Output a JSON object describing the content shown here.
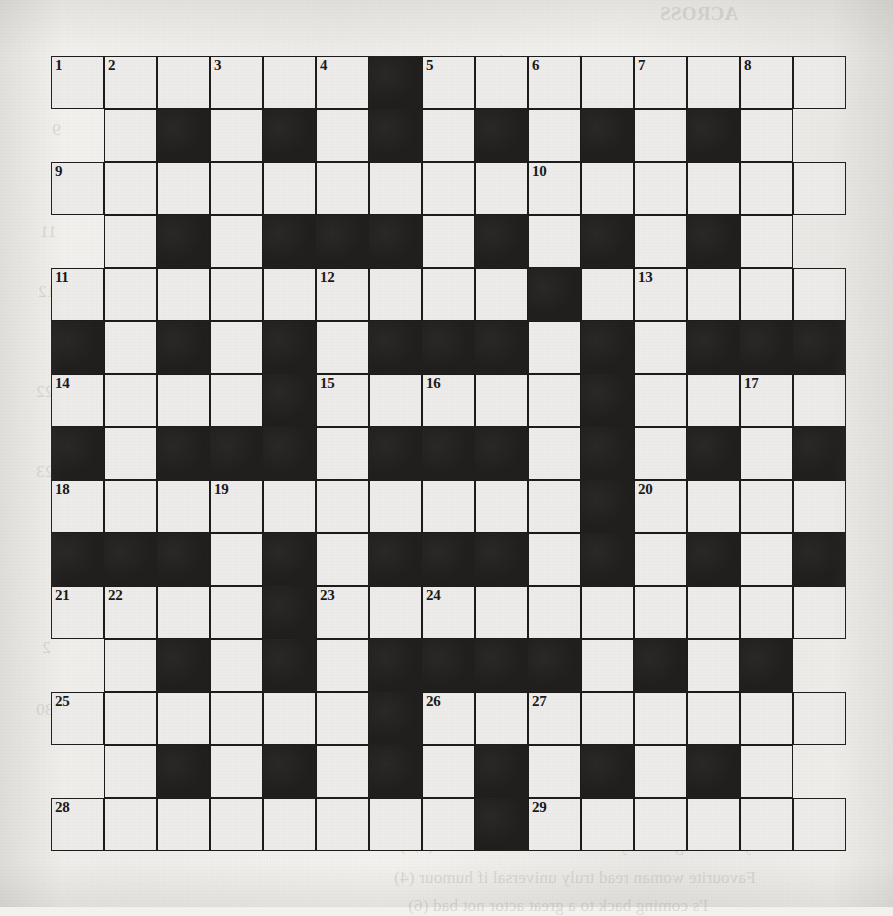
{
  "page": {
    "type": "printed crossword puzzle grid",
    "media": "scanned newspaper / puzzle-book page",
    "background_color": "#f2f1ee",
    "ink_color": "#1f1e1d",
    "cell_fill_color": "#edecea"
  },
  "grid": {
    "columns": 15,
    "rows": 15,
    "cell_size_px": 53,
    "origin_x_px": 51,
    "origin_y_px": 56,
    "legend": {
      "w": "white lettered square",
      "b": "blocked black square",
      "o": "outside the grid"
    },
    "rows_pattern": [
      "wwwwwwbwwwwwwww",
      "owbwbwbwbwbwbwo",
      "wwwwwwwwwwwwwww",
      "owbwbbbwbwbwbwo",
      "wwwwwwwwwbwwwww",
      "bwbwbwbbbwbwbbb",
      "wwwwbwwwwwbwwww",
      "bwbbbwbbbwbwbwb",
      "wwwwwwwwwwbwwww",
      "bbbwbwbbbwbwbwb",
      "wwwwbwwwwwwwwww",
      "owbwbwbbbbwbwbo",
      "wwwwwwbwwwwwwww",
      "owbwbwbwbwbwbwo",
      "wwwwwwwwbwwwwww"
    ],
    "numbered_cells": [
      {
        "number": 1,
        "row": 1,
        "col": 1
      },
      {
        "number": 2,
        "row": 1,
        "col": 2
      },
      {
        "number": 3,
        "row": 1,
        "col": 4
      },
      {
        "number": 4,
        "row": 1,
        "col": 6
      },
      {
        "number": 5,
        "row": 1,
        "col": 8
      },
      {
        "number": 6,
        "row": 1,
        "col": 10
      },
      {
        "number": 7,
        "row": 1,
        "col": 12
      },
      {
        "number": 8,
        "row": 1,
        "col": 14
      },
      {
        "number": 9,
        "row": 3,
        "col": 1
      },
      {
        "number": 10,
        "row": 3,
        "col": 10
      },
      {
        "number": 11,
        "row": 5,
        "col": 1
      },
      {
        "number": 12,
        "row": 5,
        "col": 6
      },
      {
        "number": 13,
        "row": 5,
        "col": 12
      },
      {
        "number": 14,
        "row": 7,
        "col": 1
      },
      {
        "number": 15,
        "row": 7,
        "col": 6
      },
      {
        "number": 16,
        "row": 7,
        "col": 8
      },
      {
        "number": 17,
        "row": 7,
        "col": 14
      },
      {
        "number": 18,
        "row": 9,
        "col": 1
      },
      {
        "number": 19,
        "row": 9,
        "col": 4
      },
      {
        "number": 20,
        "row": 9,
        "col": 12
      },
      {
        "number": 21,
        "row": 11,
        "col": 1
      },
      {
        "number": 22,
        "row": 11,
        "col": 2
      },
      {
        "number": 23,
        "row": 11,
        "col": 6
      },
      {
        "number": 24,
        "row": 11,
        "col": 8
      },
      {
        "number": 25,
        "row": 13,
        "col": 1
      },
      {
        "number": 26,
        "row": 13,
        "col": 8
      },
      {
        "number": 27,
        "row": 13,
        "col": 10
      },
      {
        "number": 28,
        "row": 15,
        "col": 1
      },
      {
        "number": 29,
        "row": 15,
        "col": 10
      }
    ]
  },
  "bleed_through": {
    "note": "faint mirrored text showing through the paper from the reverse side",
    "items": [
      {
        "text": "ACROSS",
        "x": 660,
        "y": 3,
        "size": 19,
        "bold": true
      },
      {
        "text": "Runner in a race to introduce a new line (8)",
        "x": 452,
        "y": 52,
        "size": 17,
        "bold": false
      },
      {
        "text": "Nonsense talk heard chiefly on the radio (4)",
        "x": 440,
        "y": 86,
        "size": 17,
        "bold": false
      },
      {
        "text": "Robbed a place, getting in again to take",
        "x": 452,
        "y": 118,
        "size": 17,
        "bold": false
      },
      {
        "text": "some of the money (6)",
        "x": 470,
        "y": 146,
        "size": 17,
        "bold": false
      },
      {
        "text": "Record for pleasant chap found in lodge (5)",
        "x": 430,
        "y": 180,
        "size": 17,
        "bold": false
      },
      {
        "text": "Pair surrendering a bit of land at first (4)",
        "x": 450,
        "y": 212,
        "size": 17,
        "bold": false
      },
      {
        "text": "One who has stirred trouble in action (7)",
        "x": 442,
        "y": 248,
        "size": 17,
        "bold": false
      },
      {
        "text": "Passionate client getting up before the fall (4)",
        "x": 416,
        "y": 290,
        "size": 17,
        "bold": false
      },
      {
        "text": "Admits a connection to a shuttered",
        "x": 470,
        "y": 322,
        "size": 17,
        "bold": false
      },
      {
        "text": "building before it is up (6)",
        "x": 480,
        "y": 350,
        "size": 17,
        "bold": false
      },
      {
        "text": "A woman will be fly maker (3)",
        "x": 430,
        "y": 388,
        "size": 17,
        "bold": false
      },
      {
        "text": "Group able to write and handle a table-",
        "x": 440,
        "y": 418,
        "size": 17,
        "bold": false
      },
      {
        "text": "book carries some thirty-nine talks (5)",
        "x": 446,
        "y": 448,
        "size": 17,
        "bold": false
      },
      {
        "text": "Foreign celebrity, never short English essay (9)",
        "x": 420,
        "y": 502,
        "size": 17,
        "bold": false
      },
      {
        "text": "DOWN",
        "x": 660,
        "y": 582,
        "size": 19,
        "bold": true
      },
      {
        "text": "Nor the plays in the same order (5)",
        "x": 440,
        "y": 652,
        "size": 17,
        "bold": false
      },
      {
        "text": "Farmers about an animal at a top person (6)",
        "x": 418,
        "y": 702,
        "size": 17,
        "bold": false
      },
      {
        "text": "Happy to say that's a shining ornament",
        "x": 450,
        "y": 738,
        "size": 17,
        "bold": false
      },
      {
        "text": "Reserve or Old's driver, leading a car on (4)",
        "x": 420,
        "y": 770,
        "size": 17,
        "bold": false
      },
      {
        "text": "Supporting up the curtain (7)",
        "x": 446,
        "y": 806,
        "size": 17,
        "bold": false
      },
      {
        "text": "Anyone can get really tired - I'm none the wiser (4,3)",
        "x": 400,
        "y": 836,
        "size": 17,
        "bold": false
      },
      {
        "text": "Favourite woman read truly universal if humour (4)",
        "x": 394,
        "y": 868,
        "size": 17,
        "bold": false
      },
      {
        "text": "I's coming back to a great actor not bad (6)",
        "x": 408,
        "y": 896,
        "size": 17,
        "bold": false
      },
      {
        "text": "9",
        "x": 52,
        "y": 120,
        "size": 17,
        "bold": false
      },
      {
        "text": "11",
        "x": 40,
        "y": 222,
        "size": 17,
        "bold": false
      },
      {
        "text": "12",
        "x": 38,
        "y": 282,
        "size": 17,
        "bold": false
      },
      {
        "text": "22",
        "x": 36,
        "y": 382,
        "size": 17,
        "bold": false
      },
      {
        "text": "23",
        "x": 36,
        "y": 462,
        "size": 17,
        "bold": false
      },
      {
        "text": "30",
        "x": 36,
        "y": 700,
        "size": 17,
        "bold": false
      },
      {
        "text": "2",
        "x": 42,
        "y": 638,
        "size": 17,
        "bold": false
      }
    ]
  }
}
